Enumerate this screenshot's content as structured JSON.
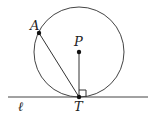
{
  "diagram": {
    "points": {
      "A": {
        "label": "A",
        "x": 39,
        "y": 33
      },
      "P": {
        "label": "P",
        "x": 79,
        "y": 52
      },
      "T": {
        "label": "T",
        "x": 79,
        "y": 97
      }
    },
    "line_label": "ℓ",
    "circle": {
      "center": "P",
      "radius": 45
    },
    "segments": [
      "AT",
      "PT"
    ],
    "right_angle_at": "T",
    "colors": {
      "stroke": "#333333",
      "point": "#111111"
    }
  }
}
